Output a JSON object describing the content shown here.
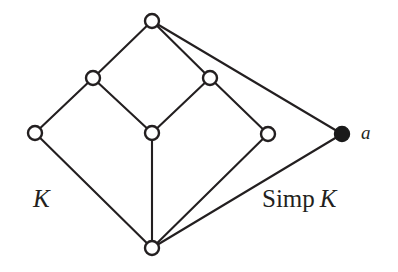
{
  "figure": {
    "width": 398,
    "height": 272,
    "background_color": "#ffffff",
    "ink_color": "#231f20"
  },
  "labels": {
    "left_complex": "K",
    "right_complex_prefix": "Simp",
    "right_complex_italic": "K",
    "apex_vertex": "a"
  },
  "graph": {
    "node_radius": 7,
    "nodes": [
      {
        "id": "top",
        "name": "top-vertex",
        "x": 152,
        "y": 21,
        "style": "open"
      },
      {
        "id": "upper_left",
        "name": "upper-left-vertex",
        "x": 93,
        "y": 78,
        "style": "open"
      },
      {
        "id": "upper_right",
        "name": "upper-right-vertex",
        "x": 210,
        "y": 78,
        "style": "open"
      },
      {
        "id": "left",
        "name": "left-vertex",
        "x": 35,
        "y": 133,
        "style": "open"
      },
      {
        "id": "center",
        "name": "center-vertex",
        "x": 152,
        "y": 133,
        "style": "open"
      },
      {
        "id": "right",
        "name": "right-vertex",
        "x": 268,
        "y": 134,
        "style": "open"
      },
      {
        "id": "apex",
        "name": "apex-vertex-a",
        "x": 342,
        "y": 134,
        "style": "filled"
      },
      {
        "id": "bottom",
        "name": "bottom-vertex",
        "x": 152,
        "y": 248,
        "style": "open"
      }
    ],
    "edges": [
      {
        "from": "top",
        "to": "upper_left"
      },
      {
        "from": "top",
        "to": "upper_right"
      },
      {
        "from": "top",
        "to": "apex"
      },
      {
        "from": "upper_left",
        "to": "left"
      },
      {
        "from": "upper_left",
        "to": "center"
      },
      {
        "from": "upper_right",
        "to": "center"
      },
      {
        "from": "upper_right",
        "to": "right"
      },
      {
        "from": "left",
        "to": "bottom"
      },
      {
        "from": "center",
        "to": "bottom"
      },
      {
        "from": "right",
        "to": "bottom"
      },
      {
        "from": "apex",
        "to": "bottom"
      }
    ]
  },
  "label_positions": {
    "left_complex": {
      "x": 33,
      "y": 186
    },
    "right_complex": {
      "x": 262,
      "y": 186
    },
    "apex_vertex": {
      "x": 361,
      "y": 123
    }
  }
}
